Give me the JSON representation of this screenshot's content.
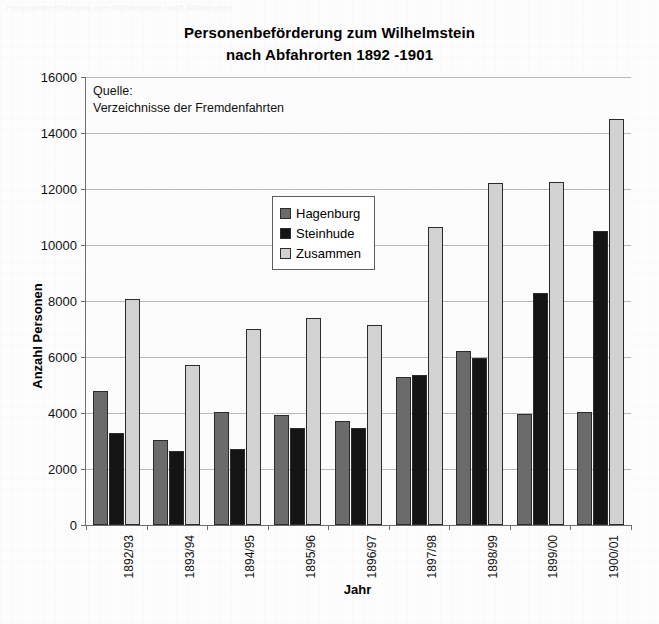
{
  "page": {
    "ghost_header": "Personenbeförderung zum Wilhelmstein nach Abfahrorten"
  },
  "chart_data": {
    "type": "bar",
    "title": "Personenbeförderung zum Wilhelmstein\nnach Abfahrorten 1892 -1901",
    "title_line1": "Personenbeförderung zum Wilhelmstein",
    "title_line2": "nach Abfahrorten 1892 -1901",
    "xlabel": "Jahr",
    "ylabel": "Anzahl Personen",
    "ylim": [
      0,
      16000
    ],
    "ytick_step": 2000,
    "yticks": [
      0,
      2000,
      4000,
      6000,
      8000,
      10000,
      12000,
      14000,
      16000
    ],
    "ytick_labels": [
      "0",
      "2000",
      "4000",
      "6000",
      "8000",
      "10000",
      "12000",
      "14000",
      "16000"
    ],
    "grid": true,
    "legend_position": "upper-center-inside",
    "categories": [
      "1892/93",
      "1893/94",
      "1894/95",
      "1895/96",
      "1896/97",
      "1897/98",
      "1898/99",
      "1899/00",
      "1900/01"
    ],
    "series": [
      {
        "name": "Hagenburg",
        "color": "#6b6b6b",
        "values": [
          4780,
          3050,
          4050,
          3930,
          3700,
          5300,
          6200,
          3980,
          4050
        ]
      },
      {
        "name": "Steinhude",
        "color": "#141414",
        "values": [
          3300,
          2650,
          2730,
          3480,
          3470,
          5350,
          5980,
          8300,
          10500
        ]
      },
      {
        "name": "Zusammen",
        "color": "#d2d2d2",
        "values": [
          8080,
          5700,
          7000,
          7380,
          7160,
          10650,
          12200,
          12250,
          14500
        ]
      }
    ],
    "annotations": [
      {
        "name": "source-note",
        "line1": "Quelle:",
        "line2": "Verzeichnisse der Fremdenfahrten"
      }
    ]
  }
}
